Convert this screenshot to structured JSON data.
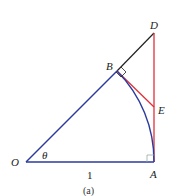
{
  "diagram": {
    "caption": "(a)",
    "points": {
      "O": {
        "label": "O",
        "x": 26,
        "y": 162
      },
      "A": {
        "label": "A",
        "x": 154,
        "y": 162
      },
      "B": {
        "label": "B",
        "x": 117,
        "y": 71
      },
      "D": {
        "label": "D",
        "x": 154,
        "y": 33
      },
      "E": {
        "label": "E",
        "x": 154,
        "y": 107
      }
    },
    "angle_label": "θ",
    "radius_label": "1",
    "colors": {
      "blue": "#2b3a9c",
      "red": "#e0303a",
      "black": "#222222",
      "right_angle": "#9aa8a0"
    },
    "segments": [
      {
        "from": "O",
        "to": "B",
        "color": "blue"
      },
      {
        "from": "O",
        "to": "A",
        "color": "blue"
      },
      {
        "from": "B",
        "to": "D",
        "color": "black"
      },
      {
        "from": "A",
        "to": "D",
        "color": "red"
      },
      {
        "from": "B",
        "to": "E",
        "color": "red"
      },
      {
        "arc": "B-A",
        "center": "O",
        "color": "blue"
      }
    ]
  }
}
